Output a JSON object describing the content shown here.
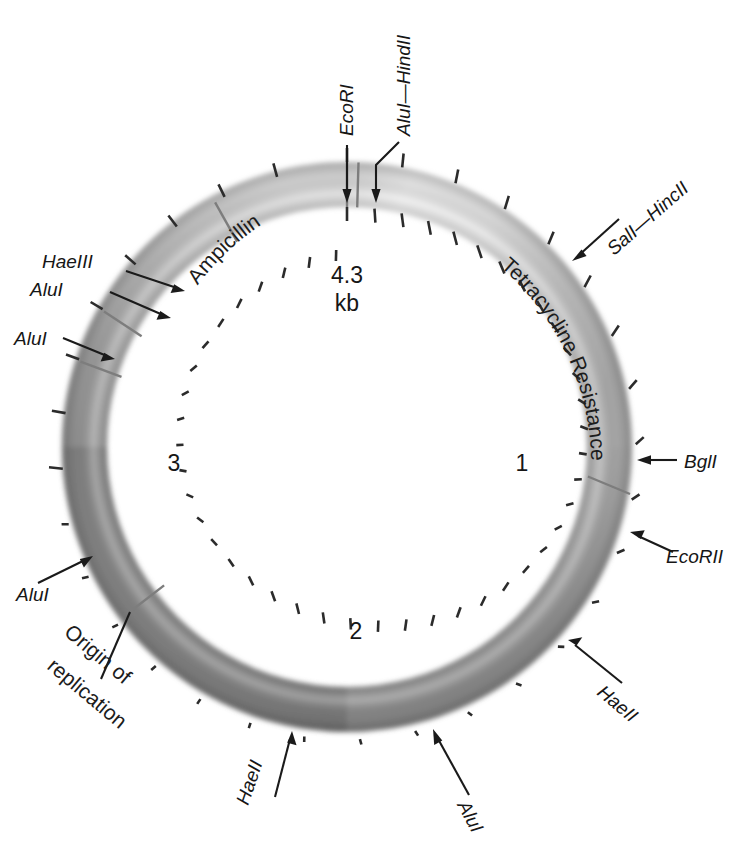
{
  "figure": {
    "center_labels": {
      "size": "4.3",
      "unit": "kb",
      "tick_1": "1",
      "tick_2": "2",
      "tick_3": "3"
    },
    "genes": [
      {
        "name": "ampicillin-resistance",
        "label": "Ampicillin Resistance"
      },
      {
        "name": "tetracycline-resistance",
        "label": "Tetracycline Resistance"
      },
      {
        "name": "origin-of-replication",
        "label_line1": "Origin of",
        "label_line2": "replication"
      }
    ],
    "restriction_sites": [
      {
        "name": "ecori",
        "label": "EcoRI",
        "italic_prefix": "Eco",
        "roman": "RI"
      },
      {
        "name": "alui-hindii",
        "label": "AluI—HindII"
      },
      {
        "name": "sali-hincii",
        "label": "SalI—HincII"
      },
      {
        "name": "bgli",
        "label": "BglI"
      },
      {
        "name": "ecorii",
        "label": "EcoRII"
      },
      {
        "name": "haeii-right",
        "label": "HaeII"
      },
      {
        "name": "alui-bottom",
        "label": "AluI"
      },
      {
        "name": "haeii-bottom",
        "label": "HaeII"
      },
      {
        "name": "alui-left-lower",
        "label": "AluI"
      },
      {
        "name": "alui-left-upper",
        "label": "AluI"
      },
      {
        "name": "haeiii-left",
        "label": "HaeIII"
      },
      {
        "name": "alui-left-mid",
        "label": "AluI"
      }
    ],
    "colors": {
      "ring_light": "#e8e8e8",
      "ring_mid": "#b8b8b8",
      "ring_dark": "#8f8f8f",
      "ring_darkest": "#747474",
      "text": "#161616",
      "tick": "#2b2b2b"
    },
    "geometry": {
      "center_x": 347,
      "center_y": 447,
      "outer_radius": 285,
      "inner_radius": 240
    }
  }
}
